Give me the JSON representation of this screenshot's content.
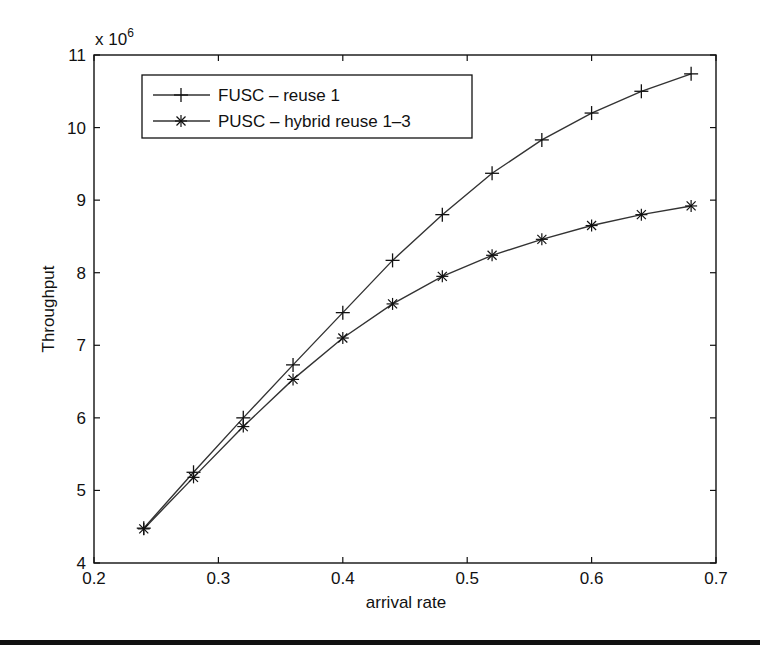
{
  "chart_data": {
    "type": "line",
    "title": "",
    "xlabel": "arrival rate",
    "ylabel": "Throughput",
    "y_multiplier": "x 10",
    "y_multiplier_exp": "6",
    "xlim": [
      0.2,
      0.7
    ],
    "ylim": [
      4,
      11
    ],
    "x_ticks": [
      "0.2",
      "0.3",
      "0.4",
      "0.5",
      "0.6",
      "0.7"
    ],
    "y_ticks": [
      "4",
      "5",
      "6",
      "7",
      "8",
      "9",
      "10",
      "11"
    ],
    "grid": false,
    "legend_position": "upper left",
    "x": [
      0.24,
      0.28,
      0.32,
      0.36,
      0.4,
      0.44,
      0.48,
      0.52,
      0.56,
      0.6,
      0.64,
      0.68
    ],
    "series": [
      {
        "name": "FUSC – reuse 1",
        "marker": "+",
        "values": [
          4.48,
          5.25,
          6.0,
          6.73,
          7.45,
          8.17,
          8.8,
          9.37,
          9.83,
          10.2,
          10.5,
          10.74
        ]
      },
      {
        "name": "PUSC – hybrid reuse 1–3",
        "marker": "*",
        "values": [
          4.47,
          5.18,
          5.88,
          6.53,
          7.1,
          7.57,
          7.95,
          8.24,
          8.46,
          8.65,
          8.8,
          8.92
        ]
      }
    ]
  },
  "colors": {
    "line": "#333333",
    "axis": "#111111",
    "background": "#ffffff"
  }
}
